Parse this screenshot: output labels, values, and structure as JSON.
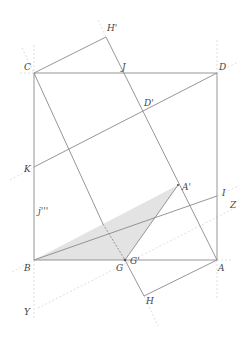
{
  "diagram": {
    "colors": {
      "line": "#8a8a8a",
      "construction": "#d4d4d4",
      "shade": "#e3e3e3",
      "label": "#444444"
    },
    "points": {
      "C": {
        "label": "C"
      },
      "D": {
        "label": "D"
      },
      "B": {
        "label": "B"
      },
      "A": {
        "label": "A"
      },
      "H_prime": {
        "label": "H'"
      },
      "J": {
        "label": "J"
      },
      "D_prime": {
        "label": "D'"
      },
      "K": {
        "label": "K"
      },
      "I": {
        "label": "I"
      },
      "A_prime": {
        "label": "A'"
      },
      "Z": {
        "label": "Z"
      },
      "j_triple": {
        "label": "j'''"
      },
      "G": {
        "label": "G"
      },
      "G_prime": {
        "label": "G'"
      },
      "H": {
        "label": "H"
      },
      "Y": {
        "label": "Y"
      }
    }
  }
}
